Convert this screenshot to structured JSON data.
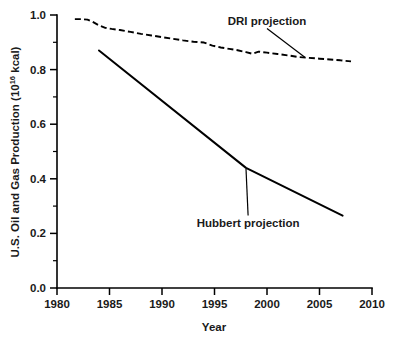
{
  "chart_data": {
    "type": "line",
    "title": "",
    "xlabel": "Year",
    "ylabel": "U.S. Oil and Gas Production (10",
    "ylabel_exponent": "16",
    "ylabel_suffix": " kcal)",
    "ylabel_full": "U.S. Oil and Gas Production (10^16 kcal)",
    "xlim": [
      1980,
      2010
    ],
    "ylim": [
      0.0,
      1.0
    ],
    "grid": false,
    "legend_position": "none",
    "xticks": [
      1980,
      1985,
      1990,
      1995,
      2000,
      2005,
      2010
    ],
    "xtick_labels": [
      "1980",
      "1985",
      "1990",
      "1995",
      "2000",
      "2005",
      "2010"
    ],
    "yticks": [
      0.0,
      0.2,
      0.4,
      0.6,
      0.8,
      1.0
    ],
    "ytick_labels": [
      "0.0",
      "0.2",
      "0.4",
      "0.6",
      "0.8",
      "1.0"
    ],
    "yticks_minor": [
      0.1,
      0.3,
      0.5,
      0.7,
      0.9
    ],
    "series": [
      {
        "name": "DRI projection",
        "style": "dashed",
        "x": [
          1981.7,
          1982.3,
          1982.9,
          1983.4,
          1984.0,
          1984.6,
          1985.2,
          1986.0,
          1987.0,
          1988.0,
          1989.0,
          1990.0,
          1991.0,
          1992.0,
          1993.0,
          1994.0,
          1994.8,
          1995.6,
          1996.4,
          1997.2,
          1998.0,
          1998.6,
          1999.2,
          2000.0,
          2001.0,
          2002.0,
          2003.0,
          2004.0,
          2005.0,
          2006.0,
          2007.0,
          2008.0
        ],
        "y": [
          0.985,
          0.985,
          0.983,
          0.975,
          0.962,
          0.953,
          0.949,
          0.945,
          0.938,
          0.931,
          0.925,
          0.919,
          0.913,
          0.907,
          0.902,
          0.899,
          0.888,
          0.881,
          0.876,
          0.871,
          0.864,
          0.858,
          0.866,
          0.862,
          0.857,
          0.852,
          0.846,
          0.843,
          0.84,
          0.837,
          0.834,
          0.83
        ]
      },
      {
        "name": "Hubbert projection",
        "style": "solid",
        "x": [
          1984.0,
          1998.0,
          2007.2
        ],
        "y": [
          0.87,
          0.44,
          0.265
        ]
      }
    ],
    "annotations": [
      {
        "text": "DRI projection",
        "label_x": 2000.0,
        "label_y": 0.965,
        "point_x": 2003.6,
        "point_y": 0.845
      },
      {
        "text": "Hubbert projection",
        "label_x": 1998.2,
        "label_y": 0.225,
        "point_x": 1998.0,
        "point_y": 0.437
      }
    ]
  }
}
